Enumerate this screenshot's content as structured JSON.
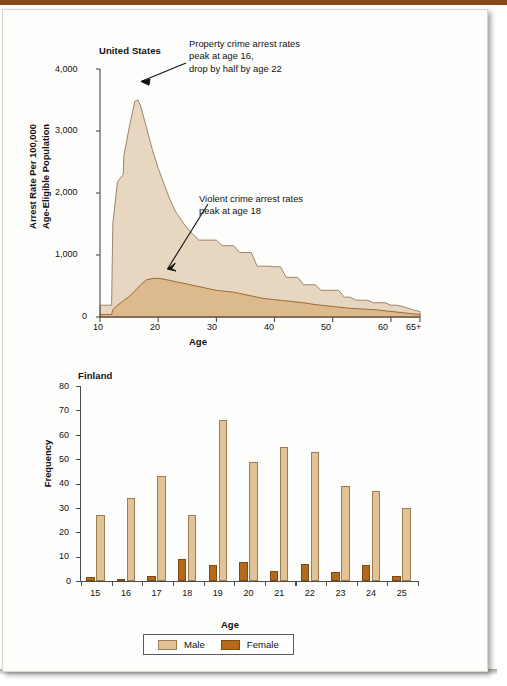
{
  "page": {
    "accent_rule_color": "#8a4a18",
    "sheet_color": "#fdfdfc"
  },
  "chart_data": [
    {
      "id": "united-states",
      "type": "area",
      "title": "United States",
      "xlabel": "Age",
      "ylabel": "Arrest Rate Per 100,000 Age-Eligible Population",
      "ylabel_line1": "Arrest Rate Per 100,000",
      "ylabel_line2": "Age-Eligible Population",
      "xlim": [
        10,
        65
      ],
      "ylim": [
        0,
        4000
      ],
      "xticks": [
        10,
        20,
        30,
        40,
        50,
        60,
        65
      ],
      "xtick_labels": [
        "10",
        "20",
        "30",
        "40",
        "50",
        "60",
        "65+"
      ],
      "yticks": [
        0,
        1000,
        2000,
        3000,
        4000
      ],
      "ytick_labels": [
        "0",
        "1,000",
        "2,000",
        "3,000",
        "4,000"
      ],
      "grid": false,
      "legend": "none",
      "colors": {
        "property_fill": "#e8d7c0",
        "property_stroke": "#9d8568",
        "violent_fill": "#ddb98e",
        "violent_stroke": "#9a6a35"
      },
      "series": [
        {
          "name": "Property crime arrest rate",
          "x": [
            10,
            11,
            12,
            12.2,
            13,
            14,
            14.1,
            15,
            16,
            16.5,
            17,
            18,
            19,
            20,
            21,
            22,
            23,
            24,
            25,
            26,
            27,
            28,
            29,
            30,
            31,
            32,
            33,
            34,
            35,
            36,
            37,
            38,
            39,
            40,
            41,
            42,
            43,
            44,
            45,
            46,
            47,
            48,
            49,
            50,
            51,
            52,
            53,
            54,
            55,
            56,
            57,
            58,
            59,
            60,
            61,
            62,
            63,
            64,
            65
          ],
          "values": [
            190,
            190,
            190,
            1500,
            2180,
            2300,
            2600,
            3050,
            3480,
            3500,
            3400,
            3050,
            2700,
            2400,
            2150,
            1900,
            1700,
            1560,
            1430,
            1330,
            1240,
            1240,
            1240,
            1240,
            1150,
            1150,
            1150,
            1040,
            1040,
            1040,
            820,
            820,
            820,
            810,
            810,
            640,
            640,
            640,
            520,
            520,
            520,
            430,
            430,
            430,
            430,
            320,
            320,
            270,
            270,
            270,
            230,
            230,
            230,
            190,
            190,
            170,
            140,
            110,
            90,
            60
          ]
        },
        {
          "name": "Violent crime arrest rate",
          "x": [
            10,
            11,
            12,
            12.2,
            13,
            14,
            15,
            16,
            17,
            18,
            19,
            20,
            21,
            22,
            23,
            24,
            25,
            26,
            27,
            28,
            29,
            30,
            31,
            32,
            33,
            34,
            35,
            36,
            37,
            38,
            39,
            40,
            41,
            42,
            43,
            44,
            45,
            46,
            47,
            48,
            49,
            50,
            51,
            52,
            53,
            54,
            55,
            56,
            57,
            58,
            59,
            60,
            61,
            62,
            63,
            64,
            65
          ],
          "values": [
            40,
            40,
            40,
            120,
            190,
            260,
            330,
            420,
            520,
            600,
            620,
            625,
            610,
            590,
            570,
            550,
            530,
            510,
            490,
            470,
            450,
            430,
            420,
            410,
            400,
            380,
            360,
            340,
            320,
            300,
            290,
            280,
            270,
            260,
            250,
            240,
            230,
            215,
            200,
            190,
            180,
            170,
            160,
            150,
            140,
            135,
            130,
            125,
            120,
            110,
            100,
            90,
            80,
            70,
            60,
            50,
            40
          ]
        }
      ],
      "annotations": [
        {
          "id": "property-annotation",
          "lines": [
            "Property crime arrest rates",
            "peak at age 16,",
            "drop by half by age 22"
          ],
          "arrow_to_x": 16,
          "arrow_to_y": 3480
        },
        {
          "id": "violent-annotation",
          "lines": [
            "Violent crime arrest rates",
            "peak at age 18"
          ],
          "arrow_to_x": 20,
          "arrow_to_y": 620
        }
      ]
    },
    {
      "id": "finland",
      "type": "bar",
      "title": "Finland",
      "xlabel": "Age",
      "ylabel": "Frequency",
      "categories": [
        "15",
        "16",
        "17",
        "18",
        "19",
        "20",
        "21",
        "22",
        "23",
        "24",
        "25"
      ],
      "yticks": [
        0,
        10,
        20,
        30,
        40,
        50,
        60,
        70,
        80
      ],
      "ytick_labels": [
        "0",
        "10",
        "20",
        "30",
        "40",
        "50",
        "60",
        "70",
        "80"
      ],
      "ylim": [
        0,
        80
      ],
      "grid": false,
      "legend_position": "bottom",
      "colors": {
        "male": "#e3c296",
        "female": "#b5691a"
      },
      "series": [
        {
          "name": "Male",
          "values": [
            27,
            34,
            43,
            27,
            66,
            49,
            55,
            53,
            39,
            37,
            30
          ]
        },
        {
          "name": "Female",
          "values": [
            1.5,
            1,
            2,
            9,
            6.5,
            8,
            4,
            7,
            3.5,
            6.5,
            2
          ]
        }
      ]
    }
  ]
}
